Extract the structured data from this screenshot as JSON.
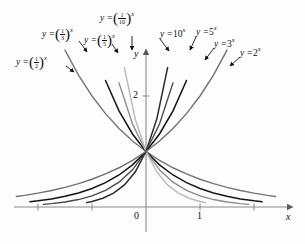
{
  "figure": {
    "background": "#fdfdfd",
    "axis_color": "#8a8a8a",
    "text_color": "#111111"
  },
  "axes": {
    "x_axis_label": "x",
    "y_axis_label": "y",
    "x_tick_labels": [
      "0",
      "1"
    ],
    "y_tick_labels": [
      "2"
    ],
    "origin_label": "0",
    "one_label": "1",
    "two_label": "2"
  },
  "labels": {
    "half": {
      "lead": "y =",
      "base_num": "1",
      "base_den": "2",
      "exp": "x"
    },
    "third": {
      "lead": "y =",
      "base_num": "1",
      "base_den": "3",
      "exp": "x"
    },
    "fifth": {
      "lead": "y =",
      "base_num": "1",
      "base_den": "5",
      "exp": "x"
    },
    "tenth": {
      "lead": "y =",
      "base_num": "1",
      "base_den": "10",
      "exp": "x"
    },
    "ten": {
      "text_lead": "y =",
      "base": "10",
      "exp": "x"
    },
    "five": {
      "text_lead": "y =",
      "base": "5",
      "exp": "x"
    },
    "three": {
      "text_lead": "y =",
      "base": "3",
      "exp": "x"
    },
    "two": {
      "text_lead": "y =",
      "base": "2",
      "exp": "x"
    }
  },
  "chart_data": {
    "type": "line",
    "title": "",
    "xlabel": "x",
    "ylabel": "y",
    "xlim": [
      -2.05,
      2.6
    ],
    "ylim": [
      -0.05,
      2.75
    ],
    "grid": false,
    "legend": "inline-annotations",
    "x_ticks": [
      -2,
      -1,
      0,
      1,
      2
    ],
    "x_tick_labels": [
      "",
      "",
      "0",
      "1",
      ""
    ],
    "y_ticks": [
      2
    ],
    "y_tick_labels": [
      "2"
    ],
    "note": "Family of exponential functions y = b^x, all passing through (0,1).",
    "series": [
      {
        "name": "y = (1/2)^x",
        "base": 0.5,
        "color": "#767676",
        "width": 1.4,
        "x": [
          -2.0,
          -1.75,
          -1.5,
          -1.25,
          -1.0,
          -0.75,
          -0.5,
          -0.25,
          0.0,
          0.25,
          0.5,
          0.75,
          1.0,
          1.25,
          1.5,
          1.75,
          2.0,
          2.25,
          2.4
        ],
        "y": [
          4.0,
          3.364,
          2.828,
          2.378,
          2.0,
          1.682,
          1.414,
          1.189,
          1.0,
          0.841,
          0.707,
          0.595,
          0.5,
          0.42,
          0.354,
          0.297,
          0.25,
          0.21,
          0.19
        ]
      },
      {
        "name": "y = (1/3)^x",
        "base": 0.3333,
        "color": "#161616",
        "width": 1.5,
        "x": [
          -1.75,
          -1.5,
          -1.25,
          -1.0,
          -0.75,
          -0.5,
          -0.25,
          0.0,
          0.25,
          0.5,
          0.75,
          1.0,
          1.25,
          1.5,
          1.75,
          2.0,
          2.15
        ],
        "y": [
          6.838,
          5.196,
          3.948,
          3.0,
          2.28,
          1.732,
          1.316,
          1.0,
          0.76,
          0.577,
          0.439,
          0.333,
          0.253,
          0.192,
          0.146,
          0.111,
          0.095
        ]
      },
      {
        "name": "y = (1/5)^x",
        "base": 0.2,
        "color": "#8c8c8c",
        "width": 1.4,
        "x": [
          -1.5,
          -1.25,
          -1.0,
          -0.75,
          -0.5,
          -0.25,
          0.0,
          0.25,
          0.5,
          0.75,
          1.0,
          1.25,
          1.5,
          1.75,
          1.9
        ],
        "y": [
          11.18,
          7.477,
          5.0,
          3.344,
          2.236,
          1.495,
          1.0,
          0.669,
          0.447,
          0.299,
          0.2,
          0.134,
          0.089,
          0.06,
          0.048
        ]
      },
      {
        "name": "y = (1/10)^x",
        "base": 0.1,
        "color": "#b9b9b9",
        "width": 1.4,
        "x": [
          -1.2,
          -1.0,
          -0.8,
          -0.6,
          -0.4,
          -0.2,
          0.0,
          0.2,
          0.4,
          0.6,
          0.8,
          1.0,
          1.1
        ],
        "y": [
          15.85,
          10.0,
          6.31,
          3.981,
          2.512,
          1.585,
          1.0,
          0.631,
          0.398,
          0.251,
          0.158,
          0.1,
          0.079
        ]
      },
      {
        "name": "y = 10^x",
        "base": 10,
        "color": "#2b2b2b",
        "width": 1.5,
        "x": [
          -1.1,
          -1.0,
          -0.8,
          -0.6,
          -0.4,
          -0.2,
          0.0,
          0.2,
          0.4,
          0.6,
          0.8,
          1.0,
          1.2
        ],
        "y": [
          0.079,
          0.1,
          0.158,
          0.251,
          0.398,
          0.631,
          1.0,
          1.585,
          2.512,
          3.981,
          6.31,
          10.0,
          15.85
        ]
      },
      {
        "name": "y = 5^x",
        "base": 5,
        "color": "#4a4a4a",
        "width": 1.4,
        "x": [
          -1.9,
          -1.75,
          -1.5,
          -1.25,
          -1.0,
          -0.75,
          -0.5,
          -0.25,
          0.0,
          0.25,
          0.5,
          0.75,
          1.0,
          1.25,
          1.5
        ],
        "y": [
          0.048,
          0.06,
          0.089,
          0.134,
          0.2,
          0.299,
          0.447,
          0.669,
          1.0,
          1.495,
          2.236,
          3.344,
          5.0,
          7.477,
          11.18
        ]
      },
      {
        "name": "y = 3^x",
        "base": 3,
        "color": "#111111",
        "width": 1.5,
        "x": [
          -2.15,
          -2.0,
          -1.75,
          -1.5,
          -1.25,
          -1.0,
          -0.75,
          -0.5,
          -0.25,
          0.0,
          0.25,
          0.5,
          0.75,
          1.0,
          1.25,
          1.5,
          1.75
        ],
        "y": [
          0.095,
          0.111,
          0.146,
          0.192,
          0.253,
          0.333,
          0.439,
          0.577,
          0.76,
          1.0,
          1.316,
          1.732,
          2.28,
          3.0,
          3.948,
          5.196,
          6.838
        ]
      },
      {
        "name": "y = 2^x",
        "base": 2,
        "color": "#707070",
        "width": 1.4,
        "x": [
          -2.4,
          -2.25,
          -2.0,
          -1.75,
          -1.5,
          -1.25,
          -1.0,
          -0.75,
          -0.5,
          -0.25,
          0.0,
          0.25,
          0.5,
          0.75,
          1.0,
          1.25,
          1.5,
          1.75,
          2.0
        ],
        "y": [
          0.19,
          0.21,
          0.25,
          0.297,
          0.354,
          0.42,
          0.5,
          0.595,
          0.707,
          0.841,
          1.0,
          1.189,
          1.414,
          1.682,
          2.0,
          2.378,
          2.828,
          3.364,
          4.0
        ]
      }
    ]
  }
}
